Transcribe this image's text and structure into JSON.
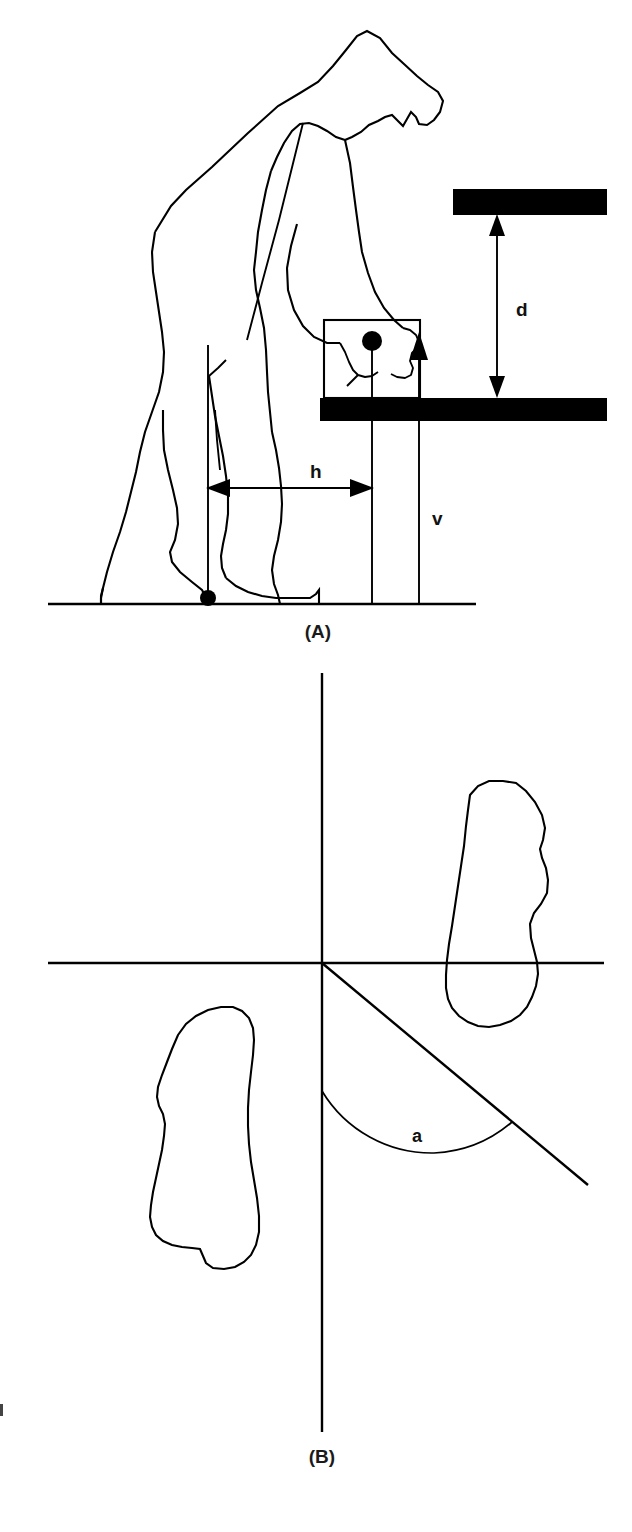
{
  "figure": {
    "background_color": "#ffffff",
    "line_color": "#000000",
    "panels": [
      {
        "id": "A",
        "caption": "(A)",
        "description": "Side view of a person bending forward to lift a box from a table, with dimension annotations",
        "labels": [
          {
            "name": "h",
            "text": "h",
            "meaning": "horizontal distance from body centre of gravity line to load line"
          },
          {
            "name": "v",
            "text": "v",
            "meaning": "vertical reference line at table edge"
          },
          {
            "name": "d",
            "text": "d",
            "meaning": "vertical clearance between table surface and shelf above"
          }
        ]
      },
      {
        "id": "B",
        "caption": "(B)",
        "description": "Top view showing two foot outlines about an origin with an angle between the vertical axis and a diagonal line",
        "labels": [
          {
            "name": "a",
            "text": "a",
            "meaning": "asymmetry angle measured from the sagittal plane"
          }
        ]
      }
    ]
  },
  "panel_a": {
    "caption": "(A)",
    "dimension_h": "h",
    "dimension_v": "v",
    "dimension_d": "d"
  },
  "panel_b": {
    "caption": "(B)",
    "angle_label": "a"
  },
  "colors": {
    "line": "#000000",
    "fill": "#000000",
    "background": "#ffffff",
    "text": "#111111"
  }
}
